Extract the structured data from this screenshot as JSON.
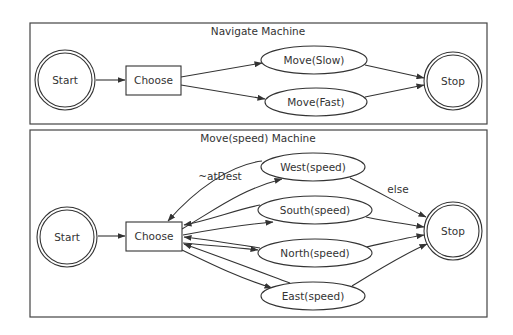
{
  "diagram": {
    "top": {
      "title": "Navigate Machine",
      "nodes": {
        "start": "Start",
        "choose": "Choose",
        "slow": "Move(Slow)",
        "fast": "Move(Fast)",
        "stop": "Stop"
      },
      "edges": [
        {
          "from": "Start",
          "to": "Choose"
        },
        {
          "from": "Choose",
          "to": "Move(Slow)"
        },
        {
          "from": "Choose",
          "to": "Move(Fast)"
        },
        {
          "from": "Move(Slow)",
          "to": "Stop"
        },
        {
          "from": "Move(Fast)",
          "to": "Stop"
        }
      ]
    },
    "bottom": {
      "title": "Move(speed) Machine",
      "nodes": {
        "start": "Start",
        "choose": "Choose",
        "west": "West(speed)",
        "south": "South(speed)",
        "north": "North(speed)",
        "east": "East(speed)",
        "stop": "Stop"
      },
      "edge_labels": {
        "loop": "~atDest",
        "exit": "else"
      },
      "edges": [
        {
          "from": "Start",
          "to": "Choose"
        },
        {
          "from": "Choose",
          "to": "West(speed)"
        },
        {
          "from": "Choose",
          "to": "South(speed)"
        },
        {
          "from": "Choose",
          "to": "North(speed)"
        },
        {
          "from": "Choose",
          "to": "East(speed)"
        },
        {
          "from": "West(speed)",
          "to": "Choose",
          "label": "~atDest"
        },
        {
          "from": "South(speed)",
          "to": "Choose"
        },
        {
          "from": "North(speed)",
          "to": "Choose"
        },
        {
          "from": "East(speed)",
          "to": "Choose"
        },
        {
          "from": "West(speed)",
          "to": "Stop",
          "label": "else"
        },
        {
          "from": "South(speed)",
          "to": "Stop"
        },
        {
          "from": "North(speed)",
          "to": "Stop"
        },
        {
          "from": "East(speed)",
          "to": "Stop"
        }
      ]
    }
  }
}
